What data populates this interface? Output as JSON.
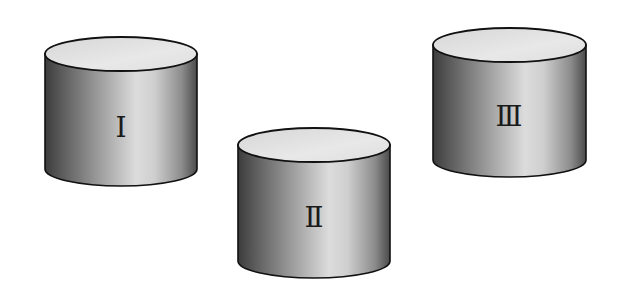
{
  "figure": {
    "width": 624,
    "height": 294,
    "background": "#ffffff"
  },
  "colors": {
    "outline": "#111111",
    "top_face": "#e2e2e2",
    "side_dark": "#3e3e3e",
    "side_mid": "#8a8a8a",
    "side_light": "#e6e6e6",
    "label": "#1a1a1a"
  },
  "cylinders": [
    {
      "id": "I",
      "label": "Ⅰ",
      "left": 45,
      "right": 197,
      "top_center_y": 54,
      "bottom_center_y": 169,
      "ry": 17,
      "label_x": 121,
      "label_y": 131
    },
    {
      "id": "II",
      "label": "Ⅱ",
      "left": 238,
      "right": 390,
      "top_center_y": 145,
      "bottom_center_y": 261,
      "ry": 17,
      "label_x": 314,
      "label_y": 221
    },
    {
      "id": "III",
      "label": "Ⅲ",
      "left": 433,
      "right": 586,
      "top_center_y": 45,
      "bottom_center_y": 160,
      "ry": 17,
      "label_x": 509,
      "label_y": 120
    }
  ]
}
